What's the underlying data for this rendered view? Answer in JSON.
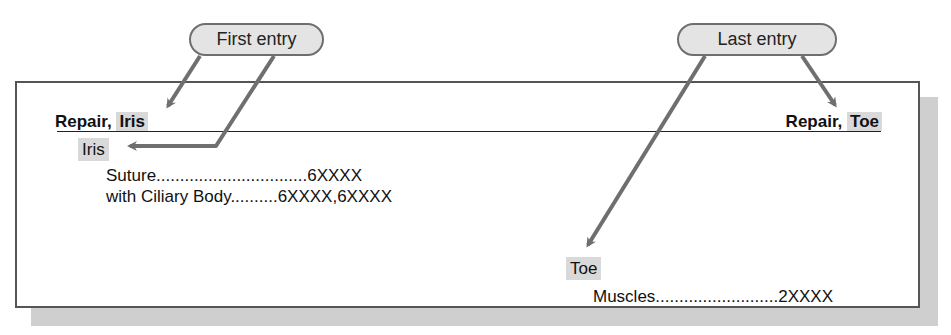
{
  "callouts": {
    "first": {
      "label": "First entry"
    },
    "last": {
      "label": "Last entry"
    }
  },
  "guide_words": {
    "left": {
      "prefix": "Repair, ",
      "highlight": "Iris"
    },
    "right": {
      "prefix": "Repair, ",
      "highlight": "Toe"
    }
  },
  "entries": [
    {
      "main_term": "Iris",
      "subterms": [
        {
          "label": "Suture",
          "leader": "................................",
          "codes": "6XXXX"
        },
        {
          "label": "with Ciliary Body",
          "leader": "..........",
          "codes": "6XXXX,6XXXX"
        }
      ]
    },
    {
      "main_term": "Toe",
      "subterms": [
        {
          "label": "Muscles",
          "leader": "..........................",
          "codes": "2XXXX"
        }
      ]
    }
  ],
  "colors": {
    "arrow": "#6f6f6f",
    "highlight": "#d9d9d9",
    "pill_fill": "#e4e4e4",
    "shadow": "#cfcfcf"
  }
}
